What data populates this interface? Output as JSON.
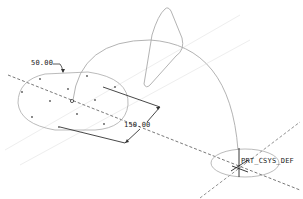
{
  "viewport": {
    "background": "#ffffff",
    "line_color": "#999999",
    "dim_color": "#333333",
    "centerline_color": "#555555"
  },
  "dimensions": [
    {
      "id": "dim-radius",
      "value": "50.00"
    },
    {
      "id": "dim-length",
      "value": "150.00"
    }
  ],
  "coordinate_system": {
    "label": "PRT_CSYS_DEF"
  }
}
